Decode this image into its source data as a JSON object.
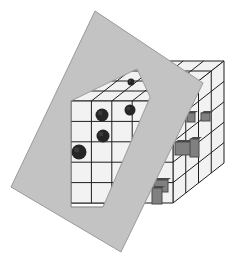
{
  "diagram": {
    "colors": {
      "background": "#ffffff",
      "plane_fill": "#c3c3c3",
      "plane_edge": "#9a9a9a",
      "cell_fill": "#f2f2f2",
      "grid_line": "#1e1e1e",
      "sphere": "#262626",
      "box_dark": "#4a4a4a",
      "box_mid": "#808080"
    },
    "cube": {
      "front_origin": [
        71,
        101
      ],
      "cell_size": 20.4,
      "cols": 5,
      "rows": 5,
      "depth_layers": 4,
      "depth_step": [
        12.75,
        -10
      ]
    },
    "plane_polygon": [
      [
        95,
        11
      ],
      [
        203,
        83
      ],
      [
        121,
        252
      ],
      [
        11,
        187
      ]
    ],
    "cutout_polygon": [
      [
        71,
        101
      ],
      [
        137,
        69
      ],
      [
        150,
        97
      ],
      [
        103,
        207
      ],
      [
        71,
        207
      ]
    ],
    "spheres": [
      {
        "cx": 102,
        "cy": 115,
        "r": 6.5
      },
      {
        "cx": 130,
        "cy": 110,
        "r": 5.5
      },
      {
        "cx": 103,
        "cy": 136,
        "r": 6.5
      },
      {
        "cx": 79,
        "cy": 152,
        "r": 7.5
      },
      {
        "cx": 131,
        "cy": 82,
        "r": 3.5
      }
    ],
    "boxes": [
      {
        "x": 187,
        "y": 113,
        "w": 8,
        "h": 9
      },
      {
        "x": 201,
        "y": 113,
        "w": 9,
        "h": 8
      },
      {
        "x": 175,
        "y": 142,
        "w": 18,
        "h": 13
      },
      {
        "x": 190,
        "y": 139,
        "w": 9,
        "h": 18
      },
      {
        "x": 154,
        "y": 180,
        "w": 14,
        "h": 12
      },
      {
        "x": 152,
        "y": 188,
        "w": 10,
        "h": 16
      }
    ]
  }
}
